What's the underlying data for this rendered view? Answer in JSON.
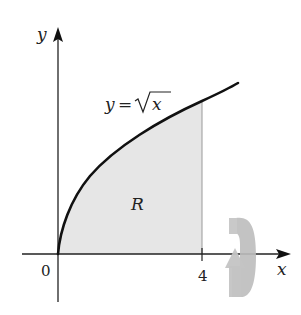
{
  "diagram": {
    "type": "region-of-revolution",
    "function_label_lhs": "y =",
    "function_label_sqrt": "x",
    "region_label": "R",
    "axis_x_label": "x",
    "axis_y_label": "y",
    "origin_label": "0",
    "bound_label": "4",
    "curve": "y = sqrt(x)",
    "region_x_range": [
      0,
      4
    ],
    "rotation_axis": "x-axis",
    "colors": {
      "curve": "#111111",
      "axes": "#222222",
      "region_fill": "#e6e6e6",
      "rotation_arrow": "#b8b8b8"
    }
  }
}
